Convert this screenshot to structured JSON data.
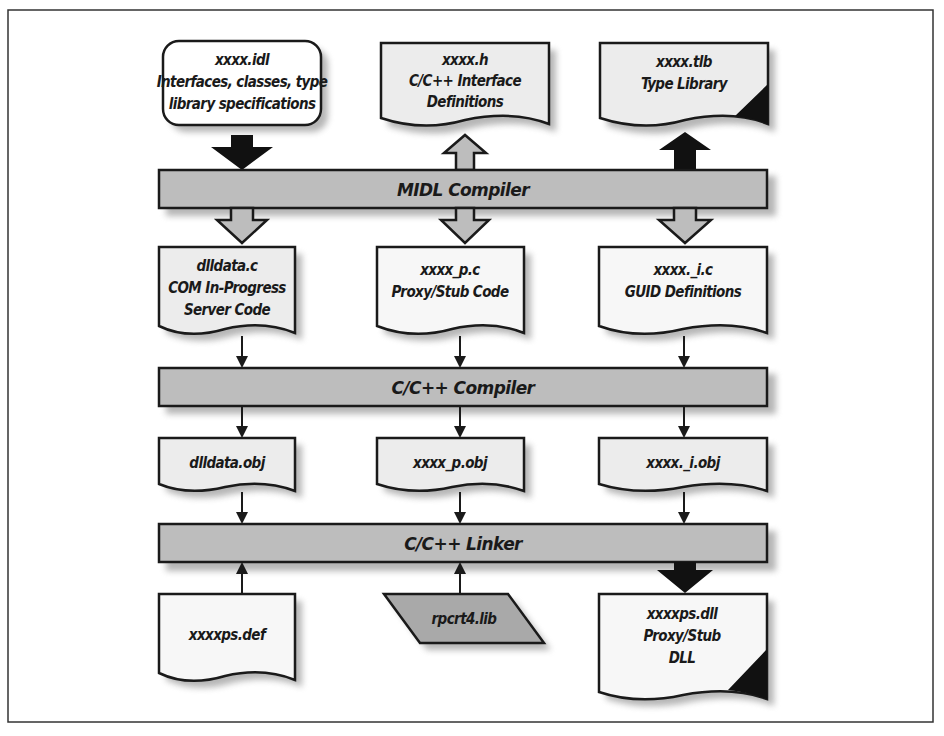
{
  "figure": {
    "frame": {
      "x": 8,
      "y": 10,
      "w": 925,
      "h": 712
    }
  },
  "inputs": {
    "idl": {
      "lines": [
        "xxxx.idl",
        "Interfaces, classes, type",
        "library specifications"
      ]
    },
    "header": {
      "lines": [
        "xxxx.h",
        "C/C++ Interface",
        "Definitions"
      ]
    },
    "tlb": {
      "lines": [
        "xxxx.tlb",
        "Type Library"
      ]
    }
  },
  "stages": {
    "midl": {
      "label": "MIDL Compiler"
    },
    "cc": {
      "label": "C/C++ Compiler"
    },
    "linker": {
      "label": "C/C++ Linker"
    }
  },
  "midl_outputs": {
    "dlldata": {
      "lines": [
        "dlldata.c",
        "COM In-Progress",
        "Server Code"
      ]
    },
    "proxy": {
      "lines": [
        "xxxx_p.c",
        "Proxy/Stub Code"
      ]
    },
    "guid": {
      "lines": [
        "xxxx._i.c",
        "GUID Definitions"
      ]
    }
  },
  "objects": {
    "dlldata_obj": {
      "label": "dlldata.obj"
    },
    "proxy_obj": {
      "label": "xxxx_p.obj"
    },
    "guid_obj": {
      "label": "xxxx._i.obj"
    }
  },
  "link_inputs": {
    "def": {
      "label": "xxxxps.def"
    },
    "lib": {
      "label": "rpcrt4.lib"
    }
  },
  "output": {
    "dll": {
      "lines": [
        "xxxxps.dll",
        "Proxy/Stub",
        "DLL"
      ]
    }
  },
  "colors": {
    "bar_fill": "#bdbdbd",
    "doc_fill": "#ececec",
    "lib_fill": "#a9a9a9",
    "stroke": "#1a1a1a",
    "arrow_dark": "#111111"
  }
}
